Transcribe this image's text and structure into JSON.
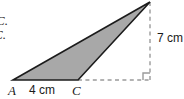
{
  "figure": {
    "kind": "geometry-triangle-diagram",
    "statement_fragments": [
      "C.",
      "C."
    ],
    "vertex_labels": {
      "a": "A",
      "c": "C"
    },
    "dimensions": {
      "base_label": "4 cm",
      "height_label": "7 cm"
    },
    "colors": {
      "fill": "#a8a8a8",
      "outline": "#1c1c1c",
      "dashed": "#9b9b9b",
      "text": "#1a1a1a",
      "background": "#ffffff"
    },
    "geometry": {
      "vertex_a": [
        13,
        80
      ],
      "vertex_c": [
        78,
        80
      ],
      "vertex_apex": [
        150,
        2
      ],
      "right_angle_corner": [
        150,
        80
      ],
      "dashed_vertical": [
        [
          150,
          2
        ],
        [
          150,
          80
        ]
      ],
      "dashed_horizontal": [
        [
          78,
          80
        ],
        [
          150,
          80
        ]
      ],
      "right_angle_marker_size": 7
    }
  }
}
